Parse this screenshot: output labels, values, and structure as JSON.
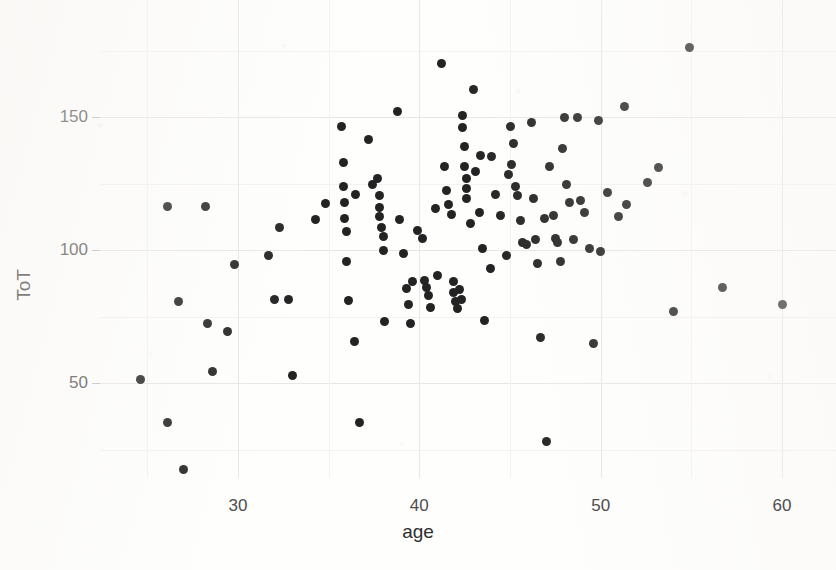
{
  "chart_data": {
    "type": "scatter",
    "title": "",
    "xlabel": "age",
    "ylabel": "ToT",
    "xlim": [
      23.5,
      61.0
    ],
    "ylim": [
      10.0,
      182.0
    ],
    "grid": true,
    "legend": null,
    "x_ticks": [
      30,
      40,
      50,
      60
    ],
    "x_tick_labels": [
      "30",
      "40",
      "50",
      "60"
    ],
    "x_minor_ticks": [
      25,
      35,
      45,
      55
    ],
    "y_ticks": [
      50,
      100,
      150
    ],
    "y_tick_labels": [
      "50",
      "100",
      "150"
    ],
    "y_minor_ticks": [
      25,
      75,
      125,
      175
    ],
    "marker": {
      "shape": "circle",
      "color": "#232323",
      "size_px": 9
    },
    "n_points": 126,
    "points": [
      {
        "x": 24.6,
        "y": 51.5
      },
      {
        "x": 26.1,
        "y": 116.5
      },
      {
        "x": 26.1,
        "y": 35.0
      },
      {
        "x": 26.7,
        "y": 80.5
      },
      {
        "x": 27.0,
        "y": 17.5
      },
      {
        "x": 28.2,
        "y": 116.5
      },
      {
        "x": 28.3,
        "y": 72.5
      },
      {
        "x": 28.6,
        "y": 54.5
      },
      {
        "x": 29.4,
        "y": 69.5
      },
      {
        "x": 29.8,
        "y": 94.5
      },
      {
        "x": 31.7,
        "y": 98.0
      },
      {
        "x": 32.0,
        "y": 81.5
      },
      {
        "x": 32.3,
        "y": 108.5
      },
      {
        "x": 32.8,
        "y": 81.5
      },
      {
        "x": 33.0,
        "y": 53.0
      },
      {
        "x": 34.3,
        "y": 111.5
      },
      {
        "x": 34.8,
        "y": 117.5
      },
      {
        "x": 35.7,
        "y": 146.5
      },
      {
        "x": 35.8,
        "y": 133.0
      },
      {
        "x": 35.8,
        "y": 124.0
      },
      {
        "x": 35.9,
        "y": 112.0
      },
      {
        "x": 36.0,
        "y": 107.0
      },
      {
        "x": 36.0,
        "y": 95.5
      },
      {
        "x": 36.1,
        "y": 81.0
      },
      {
        "x": 36.4,
        "y": 65.5
      },
      {
        "x": 36.7,
        "y": 35.0
      },
      {
        "x": 37.2,
        "y": 141.5
      },
      {
        "x": 37.4,
        "y": 124.5
      },
      {
        "x": 37.7,
        "y": 127.0
      },
      {
        "x": 37.8,
        "y": 120.5
      },
      {
        "x": 37.8,
        "y": 116.0
      },
      {
        "x": 37.8,
        "y": 112.5
      },
      {
        "x": 38.0,
        "y": 105.0
      },
      {
        "x": 38.0,
        "y": 100.0
      },
      {
        "x": 38.1,
        "y": 73.0
      },
      {
        "x": 38.8,
        "y": 152.0
      },
      {
        "x": 39.1,
        "y": 98.5
      },
      {
        "x": 39.3,
        "y": 85.5
      },
      {
        "x": 39.4,
        "y": 79.5
      },
      {
        "x": 39.5,
        "y": 72.5
      },
      {
        "x": 39.6,
        "y": 88.0
      },
      {
        "x": 40.2,
        "y": 104.5
      },
      {
        "x": 40.3,
        "y": 88.5
      },
      {
        "x": 40.4,
        "y": 86.0
      },
      {
        "x": 40.5,
        "y": 83.0
      },
      {
        "x": 40.6,
        "y": 78.5
      },
      {
        "x": 41.2,
        "y": 170.0
      },
      {
        "x": 41.4,
        "y": 131.5
      },
      {
        "x": 41.5,
        "y": 122.5
      },
      {
        "x": 41.6,
        "y": 117.0
      },
      {
        "x": 41.8,
        "y": 113.5
      },
      {
        "x": 41.9,
        "y": 88.0
      },
      {
        "x": 41.9,
        "y": 84.0
      },
      {
        "x": 42.0,
        "y": 80.5
      },
      {
        "x": 42.1,
        "y": 78.0
      },
      {
        "x": 42.4,
        "y": 150.5
      },
      {
        "x": 42.4,
        "y": 146.0
      },
      {
        "x": 42.5,
        "y": 139.0
      },
      {
        "x": 42.5,
        "y": 131.5
      },
      {
        "x": 42.6,
        "y": 127.0
      },
      {
        "x": 42.6,
        "y": 123.0
      },
      {
        "x": 42.6,
        "y": 119.5
      },
      {
        "x": 42.8,
        "y": 110.0
      },
      {
        "x": 43.0,
        "y": 160.5
      },
      {
        "x": 43.1,
        "y": 129.5
      },
      {
        "x": 43.3,
        "y": 114.0
      },
      {
        "x": 43.5,
        "y": 100.5
      },
      {
        "x": 43.6,
        "y": 73.5
      },
      {
        "x": 44.0,
        "y": 135.0
      },
      {
        "x": 44.2,
        "y": 121.0
      },
      {
        "x": 44.5,
        "y": 113.0
      },
      {
        "x": 44.8,
        "y": 98.0
      },
      {
        "x": 45.0,
        "y": 146.5
      },
      {
        "x": 45.1,
        "y": 132.0
      },
      {
        "x": 45.3,
        "y": 124.0
      },
      {
        "x": 45.4,
        "y": 120.5
      },
      {
        "x": 45.6,
        "y": 111.0
      },
      {
        "x": 45.7,
        "y": 103.0
      },
      {
        "x": 45.9,
        "y": 102.0
      },
      {
        "x": 46.2,
        "y": 148.0
      },
      {
        "x": 46.3,
        "y": 119.5
      },
      {
        "x": 46.4,
        "y": 104.0
      },
      {
        "x": 46.5,
        "y": 95.0
      },
      {
        "x": 46.7,
        "y": 67.0
      },
      {
        "x": 47.0,
        "y": 28.0
      },
      {
        "x": 47.2,
        "y": 131.5
      },
      {
        "x": 47.4,
        "y": 113.0
      },
      {
        "x": 47.5,
        "y": 104.5
      },
      {
        "x": 47.6,
        "y": 103.0
      },
      {
        "x": 47.8,
        "y": 95.5
      },
      {
        "x": 48.0,
        "y": 150.0
      },
      {
        "x": 48.1,
        "y": 124.5
      },
      {
        "x": 48.3,
        "y": 118.0
      },
      {
        "x": 48.5,
        "y": 104.0
      },
      {
        "x": 48.7,
        "y": 150.0
      },
      {
        "x": 48.9,
        "y": 118.5
      },
      {
        "x": 49.1,
        "y": 114.0
      },
      {
        "x": 49.4,
        "y": 100.5
      },
      {
        "x": 49.6,
        "y": 65.0
      },
      {
        "x": 50.0,
        "y": 99.5
      },
      {
        "x": 50.4,
        "y": 121.5
      },
      {
        "x": 51.0,
        "y": 112.5
      },
      {
        "x": 51.3,
        "y": 154.0
      },
      {
        "x": 51.4,
        "y": 117.0
      },
      {
        "x": 52.6,
        "y": 125.5
      },
      {
        "x": 53.2,
        "y": 131.0
      },
      {
        "x": 54.0,
        "y": 77.0
      },
      {
        "x": 54.9,
        "y": 176.0
      },
      {
        "x": 56.7,
        "y": 86.0
      },
      {
        "x": 60.0,
        "y": 79.5
      },
      {
        "x": 36.5,
        "y": 121.0
      },
      {
        "x": 37.9,
        "y": 108.5
      },
      {
        "x": 40.9,
        "y": 115.5
      },
      {
        "x": 43.9,
        "y": 93.0
      },
      {
        "x": 44.9,
        "y": 128.5
      },
      {
        "x": 35.9,
        "y": 118.0
      },
      {
        "x": 41.0,
        "y": 90.5
      },
      {
        "x": 42.2,
        "y": 85.0
      },
      {
        "x": 42.3,
        "y": 81.5
      },
      {
        "x": 43.4,
        "y": 135.5
      },
      {
        "x": 45.2,
        "y": 140.0
      },
      {
        "x": 47.9,
        "y": 138.0
      },
      {
        "x": 38.9,
        "y": 111.5
      },
      {
        "x": 39.9,
        "y": 107.5
      },
      {
        "x": 46.9,
        "y": 112.0
      },
      {
        "x": 49.9,
        "y": 148.5
      }
    ]
  },
  "axes": {
    "x_axis_name": "age",
    "y_axis_name": "ToT"
  },
  "colors": {
    "marker": "#232323",
    "gridline_major": "#e8e6e6",
    "gridline_minor": "#f3f2f1",
    "tick_text": "#4d4d4d",
    "axis_label_text": "#2f2f2f",
    "background": "#fefefd"
  }
}
